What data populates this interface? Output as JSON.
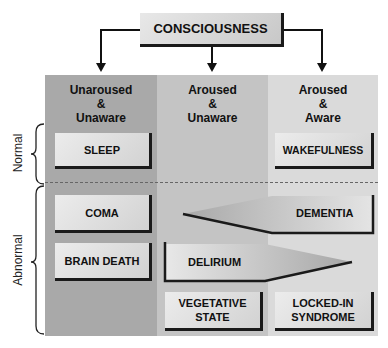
{
  "title": "CONSCIOUSNESS",
  "columns": [
    {
      "line1": "Unaroused",
      "line2": "&",
      "line3": "Unaware"
    },
    {
      "line1": "Aroused",
      "line2": "&",
      "line3": "Unaware"
    },
    {
      "line1": "Aroused",
      "line2": "&",
      "line3": "Aware"
    }
  ],
  "rows": {
    "normal": "Normal",
    "abnormal": "Abnormal"
  },
  "states": {
    "sleep": "SLEEP",
    "wakefulness": "WAKEFULNESS",
    "coma": "COMA",
    "brain_death": "BRAIN DEATH",
    "dementia": "DEMENTIA",
    "delirium": "DELIRIUM",
    "vegetative_line1": "VEGETATIVE",
    "vegetative_line2": "STATE",
    "locked_in_line1": "LOCKED-IN",
    "locked_in_line2": "SYNDROME"
  },
  "colors": {
    "col_unaroused": "#a9a9a9",
    "col_aroused_unaware": "#c4c4c4",
    "col_aroused_aware": "#dadada"
  }
}
